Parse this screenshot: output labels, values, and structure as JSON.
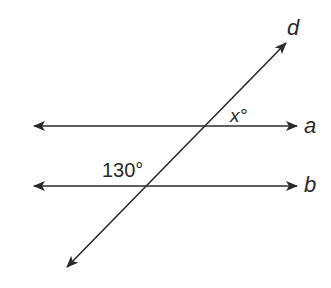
{
  "diagram": {
    "type": "parallel-lines-transversal",
    "colors": {
      "line": "#2a2a2a",
      "background": "#ffffff"
    },
    "lines": [
      {
        "name": "a",
        "label": "a",
        "kind": "horizontal"
      },
      {
        "name": "b",
        "label": "b",
        "kind": "horizontal"
      },
      {
        "name": "d",
        "label": "d",
        "kind": "transversal"
      }
    ],
    "angles": [
      {
        "label": "x°",
        "at": "intersection of d and a",
        "position": "above a, right of d"
      },
      {
        "label": "130°",
        "at": "intersection of d and b",
        "position": "above b, left of d"
      }
    ]
  },
  "labels": {
    "line_a": "a",
    "line_b": "b",
    "line_d": "d",
    "angle_x": "x°",
    "angle_130": "130°"
  }
}
